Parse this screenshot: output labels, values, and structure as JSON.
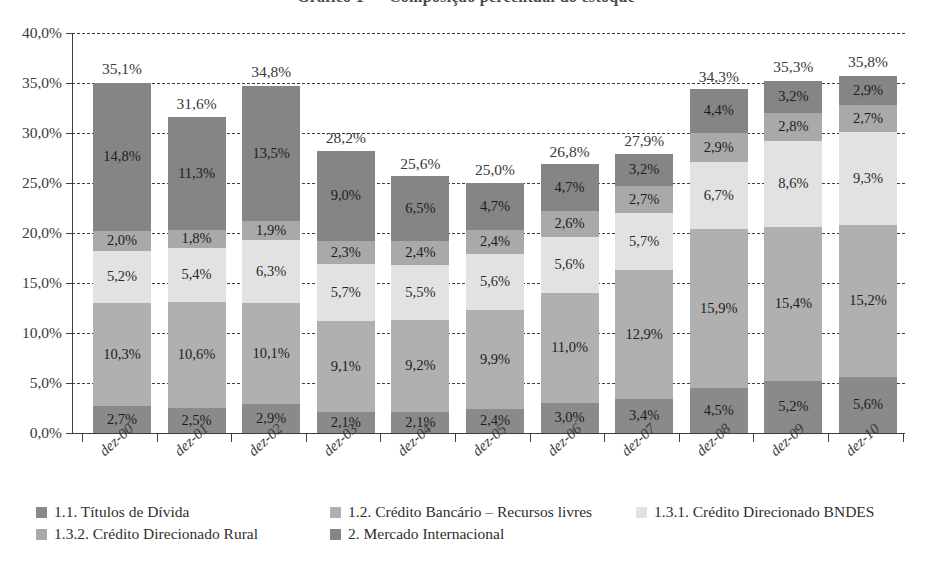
{
  "figure": {
    "title_clipped": "Gráfico 1 — Composição percentual do estoque"
  },
  "chart_data": {
    "type": "bar",
    "stacked": true,
    "title": "",
    "xlabel": "",
    "ylabel": "",
    "ylim": [
      0,
      40
    ],
    "ytick_labels": [
      "40,0%",
      "35,0%",
      "30,0%",
      "25,0%",
      "20,0%",
      "15,0%",
      "10,0%",
      "5,0%",
      "0,0%"
    ],
    "ytick_values": [
      40,
      35,
      30,
      25,
      20,
      15,
      10,
      5,
      0
    ],
    "grid": true,
    "legend_position": "bottom-left",
    "categories": [
      "dez-00",
      "dez-01",
      "dez-02",
      "dez-03",
      "dez-04",
      "dez-05",
      "dez-06",
      "dez-07",
      "dez-08",
      "dez-09",
      "dez-10"
    ],
    "series": [
      {
        "name": "1.1. Títulos de Dívida",
        "color": "#8a8a8a",
        "values": [
          2.7,
          2.5,
          2.9,
          2.1,
          2.1,
          2.4,
          3.0,
          3.4,
          4.5,
          5.2,
          5.6
        ],
        "labels": [
          "2,7%",
          "2,5%",
          "2,9%",
          "2,1%",
          "2,1%",
          "2,4%",
          "3,0%",
          "3,4%",
          "4,5%",
          "5,2%",
          "5,6%"
        ]
      },
      {
        "name": "1.2. Crédito Bancário – Recursos livres",
        "color": "#b0b0b0",
        "values": [
          10.3,
          10.6,
          10.1,
          9.1,
          9.2,
          9.9,
          11.0,
          12.9,
          15.9,
          15.4,
          15.2
        ],
        "labels": [
          "10,3%",
          "10,6%",
          "10,1%",
          "9,1%",
          "9,2%",
          "9,9%",
          "11,0%",
          "12,9%",
          "15,9%",
          "15,4%",
          "15,2%"
        ]
      },
      {
        "name": "1.3.1. Crédito Direcionado BNDES",
        "color": "#e2e2e2",
        "values": [
          5.2,
          5.4,
          6.3,
          5.7,
          5.5,
          5.6,
          5.6,
          5.7,
          6.7,
          8.6,
          9.3
        ],
        "labels": [
          "5,2%",
          "5,4%",
          "6,3%",
          "5,7%",
          "5,5%",
          "5,6%",
          "5,6%",
          "5,7%",
          "6,7%",
          "8,6%",
          "9,3%"
        ]
      },
      {
        "name": "1.3.2. Crédito Direcionado Rural",
        "color": "#a9a9a9",
        "values": [
          2.0,
          1.8,
          1.9,
          2.3,
          2.4,
          2.4,
          2.6,
          2.7,
          2.9,
          2.8,
          2.7
        ],
        "labels": [
          "2,0%",
          "1,8%",
          "1,9%",
          "2,3%",
          "2,4%",
          "2,4%",
          "2,6%",
          "2,7%",
          "2,9%",
          "2,8%",
          "2,7%"
        ]
      },
      {
        "name": "2. Mercado Internacional",
        "color": "#858585",
        "values": [
          14.8,
          11.3,
          13.5,
          9.0,
          6.5,
          4.7,
          4.7,
          3.2,
          4.4,
          3.2,
          2.9
        ],
        "labels": [
          "14,8%",
          "11,3%",
          "13,5%",
          "9,0%",
          "6,5%",
          "4,7%",
          "4,7%",
          "3,2%",
          "4,4%",
          "3,2%",
          "2,9%"
        ]
      }
    ],
    "totals": [
      35.1,
      31.6,
      34.8,
      28.2,
      25.6,
      25.0,
      26.8,
      27.9,
      34.3,
      35.3,
      35.8
    ],
    "total_labels": [
      "35,1%",
      "31,6%",
      "34,8%",
      "28,2%",
      "25,6%",
      "25,0%",
      "26,8%",
      "27,9%",
      "34,3%",
      "35,3%",
      "35,8%"
    ]
  },
  "legend": {
    "items": [
      {
        "label": "1.1. Títulos de Dívida",
        "color": "#8a8a8a"
      },
      {
        "label": "1.2. Crédito Bancário – Recursos livres",
        "color": "#b0b0b0"
      },
      {
        "label": "1.3.1. Crédito Direcionado BNDES",
        "color": "#e2e2e2"
      },
      {
        "label": "1.3.2. Crédito Direcionado Rural",
        "color": "#a9a9a9"
      },
      {
        "label": "2. Mercado Internacional",
        "color": "#858585"
      }
    ]
  }
}
